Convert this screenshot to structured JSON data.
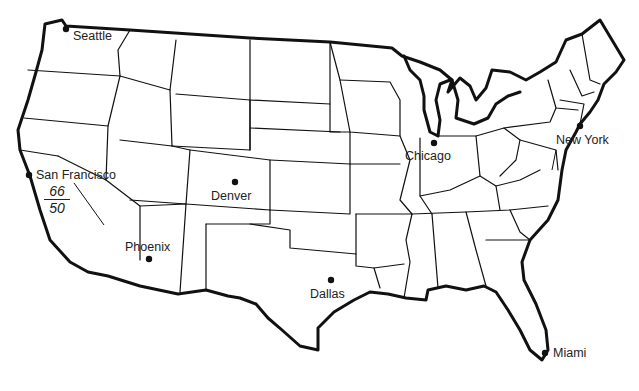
{
  "map": {
    "title": "United States outline map",
    "cities": [
      {
        "name": "Seattle",
        "x": 66,
        "y": 29
      },
      {
        "name": "San Francisco",
        "x": 29,
        "y": 175
      },
      {
        "name": "Denver",
        "x": 235,
        "y": 182
      },
      {
        "name": "Phoenix",
        "x": 149,
        "y": 259
      },
      {
        "name": "Dallas",
        "x": 331,
        "y": 280
      },
      {
        "name": "Chicago",
        "x": 434,
        "y": 143
      },
      {
        "name": "New York",
        "x": 580,
        "y": 126
      },
      {
        "name": "Miami",
        "x": 545,
        "y": 353
      }
    ],
    "annotation": {
      "numerator": "66",
      "denominator": "50"
    }
  }
}
